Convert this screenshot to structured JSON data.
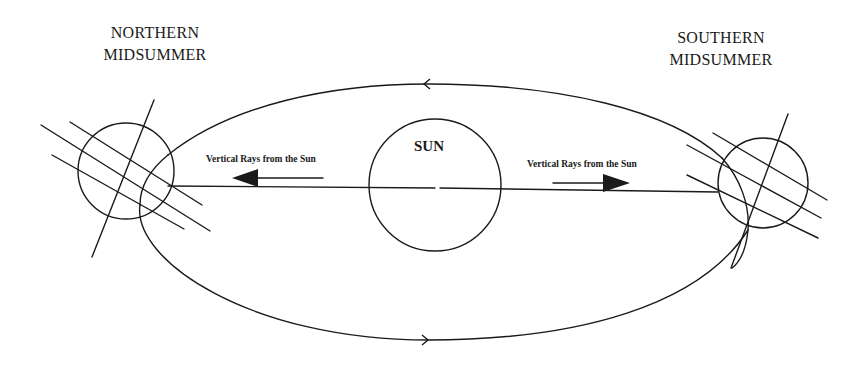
{
  "diagram": {
    "type": "earth-orbit-seasons",
    "labels": {
      "north": {
        "line1": "NORTHERN",
        "line2": "MIDSUMMER"
      },
      "south": {
        "line1": "SOUTHERN",
        "line2": "MIDSUMMER"
      },
      "sun": "SUN",
      "rays_left": "Vertical Rays from the Sun",
      "rays_right": "Vertical Rays from the Sun"
    },
    "colors": {
      "stroke": "#1a1a1a",
      "background": "#ffffff"
    },
    "nodes": [
      {
        "id": "sun",
        "label": "SUN",
        "shape": "circle"
      },
      {
        "id": "earth-northern-midsummer",
        "label": "NORTHERN MIDSUMMER",
        "shape": "circle"
      },
      {
        "id": "earth-southern-midsummer",
        "label": "SOUTHERN MIDSUMMER",
        "shape": "circle"
      }
    ],
    "edges": [
      {
        "from": "sun",
        "to": "earth-northern-midsummer",
        "label": "Vertical Rays from the Sun",
        "direction": "left"
      },
      {
        "from": "sun",
        "to": "earth-southern-midsummer",
        "label": "Vertical Rays from the Sun",
        "direction": "right"
      }
    ],
    "orbit": {
      "shape": "ellipse",
      "direction_top": "right-to-left",
      "direction_bottom": "left-to-right"
    }
  }
}
